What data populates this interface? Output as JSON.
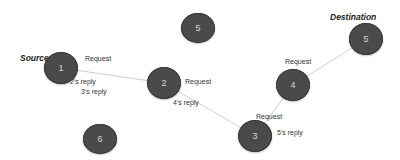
{
  "diagram": {
    "roles": {
      "source": "Source",
      "destination": "Destination"
    },
    "nodes": [
      {
        "id": "1",
        "label": "1",
        "x": 61,
        "y": 68
      },
      {
        "id": "2",
        "label": "2",
        "x": 164,
        "y": 83
      },
      {
        "id": "3",
        "label": "3",
        "x": 255,
        "y": 136
      },
      {
        "id": "4",
        "label": "4",
        "x": 293,
        "y": 85
      },
      {
        "id": "5a",
        "label": "5",
        "x": 198,
        "y": 28
      },
      {
        "id": "5b",
        "label": "5",
        "x": 366,
        "y": 39
      },
      {
        "id": "6",
        "label": "6",
        "x": 100,
        "y": 139
      }
    ],
    "edges": [
      {
        "from": "1",
        "to": "2"
      },
      {
        "from": "2",
        "to": "3"
      },
      {
        "from": "3",
        "to": "4"
      },
      {
        "from": "4",
        "to": "5b"
      }
    ],
    "annotations": {
      "req_1": "Request",
      "reply_2": "2's reply",
      "reply_3": "3's reply",
      "req_2": "Request",
      "reply_4": "4's reply",
      "req_3": "Request",
      "reply_5": "5's reply",
      "req_4": "Request"
    }
  }
}
